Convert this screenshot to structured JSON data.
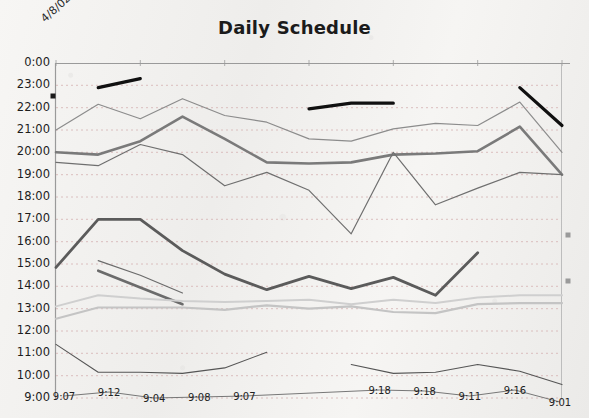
{
  "chart_data": {
    "type": "line",
    "title": "Daily Schedule",
    "corner_label": "4/8/02",
    "xlabel": "",
    "ylabel": "",
    "grid": true,
    "legend": "none",
    "y_tick_labels": [
      "0:00",
      "23:00",
      "22:00",
      "21:00",
      "20:00",
      "19:00",
      "18:00",
      "17:00",
      "16:00",
      "15:00",
      "14:00",
      "13:00",
      "12:00",
      "11:00",
      "10:00",
      "9:00"
    ],
    "ylim_top_label": "0:00",
    "ylim_bottom_label": "9:00",
    "x_categories": [
      "1",
      "2",
      "3",
      "4",
      "5",
      "6",
      "7",
      "8",
      "9",
      "10",
      "11",
      "12",
      "13"
    ],
    "data_labels": [
      "9:07",
      "9:12",
      "9:04",
      "9:08",
      "9:07",
      "",
      "",
      "9:18",
      "9:18",
      "9:11",
      "9:16",
      "9:01"
    ],
    "series": [
      {
        "name": "series-thin-upper-a",
        "color": "#8c8c8c",
        "width": 1.2,
        "values": [
          21.0,
          22.15,
          21.5,
          22.4,
          21.65,
          21.35,
          20.6,
          20.5,
          21.05,
          21.3,
          21.2,
          22.25,
          20.0
        ]
      },
      {
        "name": "series-thick-gray-upper",
        "color": "#7a7a7a",
        "width": 2.6,
        "values": [
          20.0,
          19.9,
          20.5,
          21.6,
          20.6,
          19.55,
          19.5,
          19.55,
          19.9,
          19.95,
          20.05,
          21.15,
          19.0
        ]
      },
      {
        "name": "series-thin-middle-dip",
        "color": "#6f6f6f",
        "width": 1.2,
        "values": [
          19.55,
          19.4,
          20.35,
          19.9,
          18.5,
          19.1,
          18.3,
          16.35,
          20.0,
          17.65,
          18.4,
          19.1,
          19.0
        ]
      },
      {
        "name": "series-thick-dark-lower",
        "color": "#5b5b5b",
        "width": 2.8,
        "values": [
          14.85,
          17.0,
          17.0,
          15.6,
          14.55,
          13.85,
          14.45,
          13.9,
          14.4,
          13.6,
          15.5,
          null,
          null
        ]
      },
      {
        "name": "series-short-thin-seg",
        "color": "#6b6b6b",
        "width": 1.2,
        "values": [
          null,
          15.15,
          14.5,
          13.7,
          null,
          null,
          null,
          null,
          null,
          null,
          null,
          null,
          null
        ]
      },
      {
        "name": "series-short-thick-seg",
        "color": "#6b6b6b",
        "width": 2.6,
        "values": [
          null,
          14.7,
          13.95,
          13.2,
          null,
          null,
          null,
          null,
          null,
          null,
          null,
          null,
          null
        ]
      },
      {
        "name": "series-pale-upper-band",
        "color": "#cfcfcf",
        "width": 2.0,
        "values": [
          13.1,
          13.6,
          13.45,
          13.35,
          13.3,
          13.35,
          13.4,
          13.2,
          13.4,
          13.25,
          13.5,
          13.6,
          13.6
        ]
      },
      {
        "name": "series-pale-lower-band",
        "color": "#c4c4c4",
        "width": 2.2,
        "values": [
          12.55,
          13.05,
          13.05,
          13.05,
          12.95,
          13.15,
          13.0,
          13.1,
          12.85,
          12.8,
          13.2,
          13.25,
          13.25
        ]
      },
      {
        "name": "series-bottom-thin",
        "color": "#555555",
        "width": 1.1,
        "values": [
          11.4,
          10.15,
          10.15,
          10.1,
          10.35,
          11.05,
          null,
          10.5,
          10.1,
          10.15,
          10.5,
          10.2,
          9.6
        ]
      },
      {
        "name": "series-black-seg-1",
        "color": "#101010",
        "width": 3.2,
        "values": [
          null,
          22.9,
          23.3,
          null,
          null,
          null,
          null,
          null,
          null,
          null,
          null,
          null,
          null
        ]
      },
      {
        "name": "series-black-seg-2",
        "color": "#101010",
        "width": 3.2,
        "values": [
          null,
          null,
          null,
          null,
          null,
          null,
          21.95,
          22.2,
          22.2,
          null,
          null,
          null,
          null
        ]
      },
      {
        "name": "series-black-seg-3",
        "color": "#101010",
        "width": 3.2,
        "values": [
          null,
          null,
          null,
          null,
          null,
          null,
          null,
          null,
          null,
          null,
          null,
          22.9,
          21.2
        ]
      }
    ],
    "markers": [
      {
        "name": "axis-marker-left",
        "x_px": 53,
        "y_px": 96,
        "color": "#1a1a1a",
        "size": 5
      },
      {
        "name": "axis-marker-right-upper",
        "x_px": 568,
        "y_px": 235,
        "color": "#9a9a9a",
        "size": 5
      },
      {
        "name": "axis-marker-right-lower",
        "x_px": 568,
        "y_px": 281,
        "color": "#9a9a9a",
        "size": 5
      }
    ]
  }
}
